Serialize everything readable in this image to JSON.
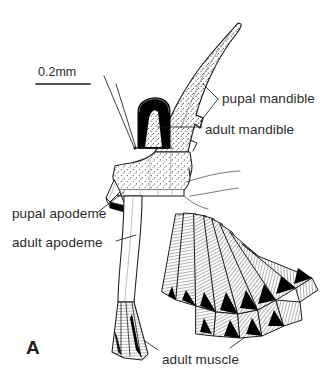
{
  "figure": {
    "panel_letter": "A",
    "scale_bar": {
      "label": "0.2mm",
      "length_px": 54
    },
    "labels": [
      {
        "id": "pupal-mandible",
        "text": "pupal mandible"
      },
      {
        "id": "adult-mandible",
        "text": "adult mandible"
      },
      {
        "id": "pupal-apodeme",
        "text": "pupal apodeme"
      },
      {
        "id": "adult-apodeme",
        "text": "adult apodeme"
      },
      {
        "id": "adult-muscle",
        "text": "adult muscle"
      }
    ],
    "colors": {
      "ink": "#1d1d1d",
      "text": "#2b2b2b",
      "background": "#ffffff",
      "fill_black": "#000000",
      "stipple": "#4a4a4a"
    }
  }
}
